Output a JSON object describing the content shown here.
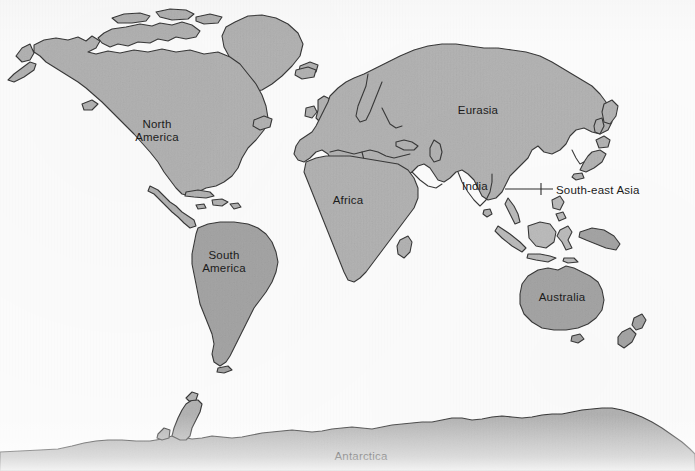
{
  "map": {
    "title": "World map with labelled continents and regions",
    "projection_note": "equirectangular-style world outline",
    "colors": {
      "background": "#fbfbfb",
      "land_fill": "#b4b4b4",
      "land_fill_dark": "#a6a6a6",
      "land_fill_light": "#bdbdbd",
      "coastline_stroke": "#3a3a3a",
      "label_text": "#1c1c1c",
      "leader_line": "#2e2e2e"
    },
    "label_font_size_px": 11.5,
    "labels": [
      {
        "id": "north-america",
        "text": "North\nAmerica",
        "x": 157,
        "y": 131,
        "align": "center"
      },
      {
        "id": "south-america",
        "text": "South\nAmerica",
        "x": 224,
        "y": 262,
        "align": "center"
      },
      {
        "id": "eurasia",
        "text": "Eurasia",
        "x": 478,
        "y": 110,
        "align": "center"
      },
      {
        "id": "africa",
        "text": "Africa",
        "x": 348,
        "y": 200,
        "align": "center"
      },
      {
        "id": "india",
        "text": "India",
        "x": 475,
        "y": 186,
        "align": "center"
      },
      {
        "id": "south-east-asia",
        "text": "South-east Asia",
        "x": 556,
        "y": 190,
        "align": "left"
      },
      {
        "id": "australia",
        "text": "Australia",
        "x": 562,
        "y": 297,
        "align": "center"
      },
      {
        "id": "antarctica",
        "text": "Antarctica",
        "x": 361,
        "y": 456,
        "align": "center"
      }
    ],
    "leader_lines": [
      {
        "id": "south-east-asia-leader",
        "from_x": 505,
        "from_y": 189,
        "to_x": 553,
        "to_y": 189,
        "tick_x": 541,
        "tick_top_y": 183,
        "tick_bottom_y": 195
      }
    ],
    "landmasses": [
      {
        "id": "north-america",
        "name": "North America"
      },
      {
        "id": "greenland",
        "name": "Greenland"
      },
      {
        "id": "canadian-arctic",
        "name": "Canadian Arctic Archipelago"
      },
      {
        "id": "central-america",
        "name": "Central America"
      },
      {
        "id": "caribbean",
        "name": "Caribbean Islands"
      },
      {
        "id": "south-america",
        "name": "South America"
      },
      {
        "id": "africa",
        "name": "Africa"
      },
      {
        "id": "madagascar",
        "name": "Madagascar"
      },
      {
        "id": "europe",
        "name": "Europe"
      },
      {
        "id": "british-isles",
        "name": "British Isles"
      },
      {
        "id": "iceland",
        "name": "Iceland"
      },
      {
        "id": "asia",
        "name": "Asia"
      },
      {
        "id": "india",
        "name": "Indian subcontinent"
      },
      {
        "id": "japan",
        "name": "Japan"
      },
      {
        "id": "sri-lanka",
        "name": "Sri Lanka"
      },
      {
        "id": "indonesia",
        "name": "Indonesian archipelago"
      },
      {
        "id": "philippines",
        "name": "Philippines"
      },
      {
        "id": "new-guinea",
        "name": "New Guinea"
      },
      {
        "id": "australia",
        "name": "Australia"
      },
      {
        "id": "tasmania",
        "name": "Tasmania"
      },
      {
        "id": "new-zealand",
        "name": "New Zealand"
      },
      {
        "id": "antarctica",
        "name": "Antarctica"
      }
    ]
  }
}
